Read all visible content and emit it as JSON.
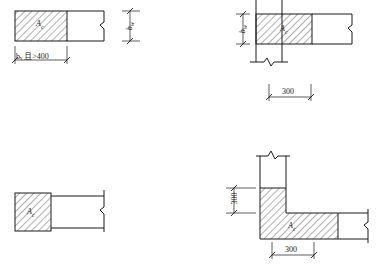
{
  "drawing": {
    "title": "Constrained boundary element area A_c configurations",
    "line_color": "#1a1a1a",
    "hatch_color": "#1a1a1a",
    "background": "#ffffff",
    "figures": [
      {
        "id": "fig-top-left",
        "name": "wall-end-no-column",
        "area_label": "A",
        "area_label_sub": "c",
        "width_dim": "bᵥ 且>400",
        "height_dim": "b",
        "height_dim_sub": "w"
      },
      {
        "id": "fig-top-right",
        "name": "wall-with-end-column",
        "area_label": "A",
        "area_label_sub": "c",
        "height_dim": "b",
        "height_dim_sub": "w",
        "width_dim": "300"
      },
      {
        "id": "fig-bottom-left",
        "name": "wall-end-square-block",
        "area_label": "A",
        "area_label_sub": "c"
      },
      {
        "id": "fig-bottom-right",
        "name": "wall-corner-L-shape",
        "area_label": "A",
        "area_label_sub": "c",
        "vertical_dim": "300",
        "horizontal_dim": "300"
      }
    ],
    "symbols": {
      "break_mark": "break-line-symbol",
      "hatch": "45-degree-section-hatch"
    }
  }
}
